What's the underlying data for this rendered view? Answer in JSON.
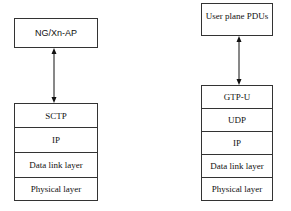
{
  "left": {
    "top_box": "NG/Xn-AP",
    "layers": [
      "SCTP",
      "IP",
      "Data link layer",
      "Physical layer"
    ]
  },
  "right": {
    "top_box": "User plane PDUs",
    "layers": [
      "GTP-U",
      "UDP",
      "IP",
      "Data link layer",
      "Physical layer"
    ]
  }
}
